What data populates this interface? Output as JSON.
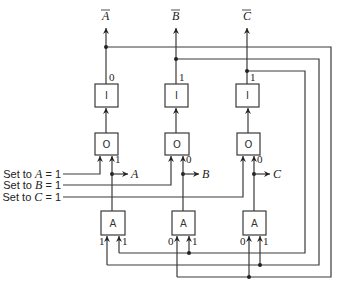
{
  "diagram": {
    "type": "logic-circuit",
    "top_outputs": [
      {
        "label": "A",
        "overbar": true,
        "column": "A"
      },
      {
        "label": "B",
        "overbar": true,
        "column": "B"
      },
      {
        "label": "C",
        "overbar": true,
        "column": "C"
      }
    ],
    "columns": [
      {
        "name": "A",
        "inverter": {
          "label": "I",
          "output_value": "0"
        },
        "or_gate": {
          "label": "O",
          "right_input_value": "1"
        },
        "output": {
          "label": "A"
        },
        "and_gate": {
          "label": "A",
          "left_input_value": "1",
          "right_input_value": "1"
        }
      },
      {
        "name": "B",
        "inverter": {
          "label": "I",
          "output_value": "1"
        },
        "or_gate": {
          "label": "O",
          "right_input_value": "0"
        },
        "output": {
          "label": "B"
        },
        "and_gate": {
          "label": "A",
          "left_input_value": "0",
          "right_input_value": "1"
        }
      },
      {
        "name": "C",
        "inverter": {
          "label": "I",
          "output_value": "1"
        },
        "or_gate": {
          "label": "O",
          "right_input_value": "0"
        },
        "output": {
          "label": "C"
        },
        "and_gate": {
          "label": "A",
          "left_input_value": "0",
          "right_input_value": "1"
        }
      }
    ],
    "set_inputs": [
      {
        "text": "Set to ",
        "var": "A",
        "suffix": " = 1"
      },
      {
        "text": "Set to ",
        "var": "B",
        "suffix": " = 1"
      },
      {
        "text": "Set to ",
        "var": "C",
        "suffix": " = 1"
      }
    ],
    "feedback": [
      {
        "from": "A-bar",
        "to": [
          "B.and.left",
          "C.and.left"
        ]
      },
      {
        "from": "B-bar",
        "to": [
          "A.and.left",
          "C.and.right"
        ]
      },
      {
        "from": "C-bar",
        "to": [
          "A.and.right",
          "B.and.right"
        ]
      }
    ]
  }
}
